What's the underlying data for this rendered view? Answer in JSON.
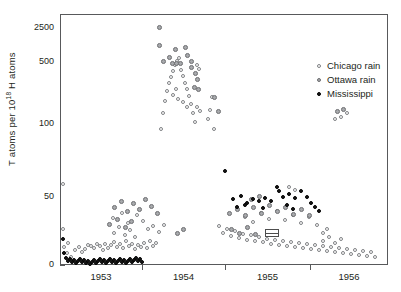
{
  "chart_data": {
    "type": "scatter",
    "title": "",
    "xlabel": "",
    "ylabel": "T atoms per 10^18 H atoms",
    "ylabel_prefix": "T atoms per 10",
    "ylabel_exponent": "18",
    "ylabel_suffix": " H atoms",
    "y_scale": "nonlinear-compressed",
    "ytick_labels": [
      "2500",
      "500",
      "100",
      "50",
      "0"
    ],
    "ytick_values": [
      2500,
      500,
      100,
      50,
      0
    ],
    "ytick_pixels": [
      28,
      62,
      124,
      197,
      265
    ],
    "xtick_labels": [
      "1953",
      "1954",
      "1955",
      "1956"
    ],
    "xtick_boundaries_px": [
      60,
      142,
      225,
      310,
      388
    ],
    "grid": false,
    "legend_position": "upper-right",
    "legend": [
      {
        "name": "Chicago rain",
        "marker": "open-circle",
        "color": "#808285"
      },
      {
        "name": "Ottawa rain",
        "marker": "gray-filled-circle",
        "color": "#a7a9ac"
      },
      {
        "name": "Mississippi",
        "marker": "black-filled-circle",
        "color": "#1a1a1a"
      }
    ],
    "annotations": [
      {
        "type": "range-box",
        "x_px": 264,
        "y_px": 228,
        "width_px": 14,
        "height_px": 8
      }
    ],
    "series": [
      {
        "name": "Chicago rain",
        "marker": "open-circle",
        "points": [
          [
            62,
            183
          ],
          [
            62,
            228
          ],
          [
            63,
            246
          ],
          [
            66,
            252
          ],
          [
            67,
            242
          ],
          [
            70,
            256
          ],
          [
            74,
            249
          ],
          [
            78,
            246
          ],
          [
            81,
            251
          ],
          [
            84,
            248
          ],
          [
            87,
            244
          ],
          [
            90,
            245
          ],
          [
            93,
            247
          ],
          [
            96,
            243
          ],
          [
            99,
            245
          ],
          [
            102,
            249
          ],
          [
            104,
            243
          ],
          [
            107,
            247
          ],
          [
            110,
            244
          ],
          [
            113,
            241
          ],
          [
            116,
            246
          ],
          [
            119,
            243
          ],
          [
            122,
            247
          ],
          [
            125,
            240
          ],
          [
            128,
            245
          ],
          [
            131,
            243
          ],
          [
            134,
            248
          ],
          [
            137,
            244
          ],
          [
            140,
            246
          ],
          [
            143,
            242
          ],
          [
            146,
            247
          ],
          [
            149,
            240
          ],
          [
            152,
            245
          ],
          [
            155,
            242
          ],
          [
            113,
            232
          ],
          [
            118,
            226
          ],
          [
            124,
            234
          ],
          [
            129,
            229
          ],
          [
            134,
            236
          ],
          [
            112,
            217
          ],
          [
            121,
            212
          ],
          [
            127,
            222
          ],
          [
            136,
            214
          ],
          [
            142,
            220
          ],
          [
            147,
            228
          ],
          [
            152,
            225
          ],
          [
            158,
            231
          ],
          [
            163,
            224
          ],
          [
            160,
            128
          ],
          [
            162,
            112
          ],
          [
            164,
            100
          ],
          [
            166,
            90
          ],
          [
            168,
            82
          ],
          [
            170,
            76
          ],
          [
            172,
            70
          ],
          [
            174,
            64
          ],
          [
            176,
            60
          ],
          [
            178,
            57
          ],
          [
            180,
            69
          ],
          [
            182,
            75
          ],
          [
            184,
            82
          ],
          [
            186,
            88
          ],
          [
            188,
            95
          ],
          [
            190,
            103
          ],
          [
            192,
            112
          ],
          [
            194,
            121
          ],
          [
            196,
            64
          ],
          [
            198,
            68
          ],
          [
            172,
            94
          ],
          [
            175,
            88
          ],
          [
            177,
            98
          ],
          [
            182,
            101
          ],
          [
            186,
            106
          ],
          [
            207,
            118
          ],
          [
            211,
            96
          ],
          [
            209,
            109
          ],
          [
            213,
            128
          ],
          [
            196,
            106
          ],
          [
            199,
            110
          ],
          [
            218,
            225
          ],
          [
            222,
            232
          ],
          [
            226,
            228
          ],
          [
            230,
            235
          ],
          [
            234,
            230
          ],
          [
            238,
            237
          ],
          [
            242,
            233
          ],
          [
            246,
            239
          ],
          [
            250,
            234
          ],
          [
            254,
            240
          ],
          [
            258,
            236
          ],
          [
            262,
            241
          ],
          [
            266,
            238
          ],
          [
            270,
            243
          ],
          [
            274,
            239
          ],
          [
            278,
            244
          ],
          [
            282,
            240
          ],
          [
            286,
            245
          ],
          [
            290,
            241
          ],
          [
            294,
            246
          ],
          [
            298,
            242
          ],
          [
            302,
            247
          ],
          [
            306,
            243
          ],
          [
            310,
            248
          ],
          [
            314,
            244
          ],
          [
            318,
            249
          ],
          [
            322,
            245
          ],
          [
            326,
            250
          ],
          [
            330,
            246
          ],
          [
            334,
            251
          ],
          [
            338,
            247
          ],
          [
            342,
            252
          ],
          [
            346,
            248
          ],
          [
            350,
            253
          ],
          [
            354,
            249
          ],
          [
            358,
            254
          ],
          [
            362,
            250
          ],
          [
            366,
            255
          ],
          [
            370,
            251
          ],
          [
            374,
            256
          ],
          [
            322,
            240
          ],
          [
            328,
            236
          ],
          [
            334,
            242
          ],
          [
            340,
            238
          ],
          [
            244,
            216
          ],
          [
            252,
            221
          ],
          [
            260,
            212
          ],
          [
            268,
            218
          ],
          [
            276,
            210
          ],
          [
            284,
            219
          ],
          [
            292,
            214
          ],
          [
            300,
            222
          ],
          [
            308,
            216
          ],
          [
            316,
            224
          ],
          [
            288,
            186
          ],
          [
            294,
            189
          ],
          [
            334,
            118
          ],
          [
            340,
            116
          ],
          [
            346,
            112
          ],
          [
            322,
            232
          ],
          [
            326,
            228
          ]
        ]
      },
      {
        "name": "Ottawa rain",
        "marker": "gray-filled-circle",
        "points": [
          [
            158,
            26
          ],
          [
            158,
            44
          ],
          [
            174,
            48
          ],
          [
            184,
            46
          ],
          [
            168,
            56
          ],
          [
            186,
            54
          ],
          [
            162,
            60
          ],
          [
            171,
            62
          ],
          [
            175,
            62
          ],
          [
            179,
            62
          ],
          [
            190,
            60
          ],
          [
            190,
            66
          ],
          [
            194,
            72
          ],
          [
            196,
            78
          ],
          [
            193,
            86
          ],
          [
            197,
            88
          ],
          [
            213,
            96
          ],
          [
            217,
            110
          ],
          [
            113,
            206
          ],
          [
            120,
            200
          ],
          [
            126,
            210
          ],
          [
            132,
            202
          ],
          [
            138,
            208
          ],
          [
            144,
            198
          ],
          [
            150,
            205
          ],
          [
            156,
            212
          ],
          [
            108,
            223
          ],
          [
            116,
            218
          ],
          [
            124,
            226
          ],
          [
            130,
            220
          ],
          [
            228,
            212
          ],
          [
            236,
            208
          ],
          [
            244,
            214
          ],
          [
            252,
            206
          ],
          [
            260,
            212
          ],
          [
            268,
            204
          ],
          [
            276,
            210
          ],
          [
            284,
            206
          ],
          [
            292,
            213
          ],
          [
            230,
            228
          ],
          [
            238,
            232
          ],
          [
            246,
            226
          ],
          [
            254,
            233
          ],
          [
            300,
            208
          ],
          [
            308,
            214
          ],
          [
            176,
            232
          ],
          [
            182,
            228
          ],
          [
            250,
            198
          ],
          [
            258,
            195
          ],
          [
            336,
            110
          ],
          [
            342,
            108
          ]
        ]
      },
      {
        "name": "Mississippi",
        "marker": "black-filled-circle",
        "points": [
          [
            62,
            238
          ],
          [
            63,
            252
          ],
          [
            65,
            257
          ],
          [
            67,
            260
          ],
          [
            69,
            258
          ],
          [
            71,
            261
          ],
          [
            73,
            259
          ],
          [
            75,
            262
          ],
          [
            77,
            260
          ],
          [
            79,
            258
          ],
          [
            81,
            261
          ],
          [
            83,
            259
          ],
          [
            85,
            262
          ],
          [
            87,
            260
          ],
          [
            89,
            263
          ],
          [
            91,
            261
          ],
          [
            93,
            259
          ],
          [
            95,
            262
          ],
          [
            97,
            260
          ],
          [
            99,
            258
          ],
          [
            101,
            261
          ],
          [
            103,
            259
          ],
          [
            105,
            262
          ],
          [
            107,
            260
          ],
          [
            109,
            258
          ],
          [
            111,
            261
          ],
          [
            113,
            259
          ],
          [
            115,
            262
          ],
          [
            117,
            260
          ],
          [
            119,
            258
          ],
          [
            121,
            261
          ],
          [
            123,
            259
          ],
          [
            125,
            262
          ],
          [
            127,
            260
          ],
          [
            129,
            258
          ],
          [
            131,
            261
          ],
          [
            133,
            259
          ],
          [
            135,
            257
          ],
          [
            137,
            260
          ],
          [
            139,
            258
          ],
          [
            141,
            261
          ],
          [
            224,
            170
          ],
          [
            232,
            198
          ],
          [
            240,
            195
          ],
          [
            246,
            202
          ],
          [
            252,
            198
          ],
          [
            258,
            200
          ],
          [
            264,
            197
          ],
          [
            270,
            200
          ],
          [
            276,
            186
          ],
          [
            278,
            190
          ],
          [
            282,
            196
          ],
          [
            288,
            193
          ],
          [
            294,
            197
          ],
          [
            300,
            190
          ],
          [
            306,
            196
          ],
          [
            236,
            206
          ],
          [
            244,
            204
          ],
          [
            262,
            207
          ],
          [
            286,
            204
          ],
          [
            292,
            208
          ],
          [
            310,
            202
          ],
          [
            314,
            206
          ],
          [
            318,
            210
          ]
        ]
      }
    ]
  },
  "axis": {
    "y_title_prefix": "T atoms per 10",
    "y_title_exp": "18",
    "y_title_suffix": " H atoms"
  }
}
